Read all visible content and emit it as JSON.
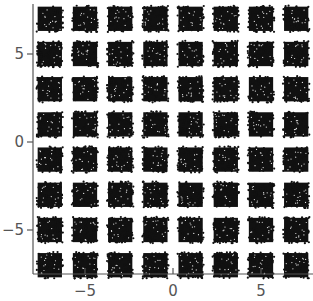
{
  "chart_data": {
    "type": "scatter",
    "title": "",
    "xlabel": "",
    "ylabel": "",
    "cluster_centers_x": [
      -7,
      -5,
      -3,
      -1,
      1,
      3,
      5,
      7
    ],
    "cluster_centers_y": [
      -7,
      -5,
      -3,
      -1,
      1,
      3,
      5,
      7
    ],
    "cluster_half_width": 0.75,
    "points_per_cluster": 260,
    "xlim": [
      -8,
      8
    ],
    "ylim": [
      -7.5,
      8
    ],
    "xticks": [
      -5,
      0,
      5
    ],
    "yticks": [
      -5,
      0,
      5
    ],
    "xtick_labels": [
      "-5",
      "0",
      "5"
    ],
    "ytick_labels": [
      "-5",
      "0",
      "5"
    ],
    "grid": false,
    "marker_color": "#111111",
    "axis_color": "#555555"
  }
}
